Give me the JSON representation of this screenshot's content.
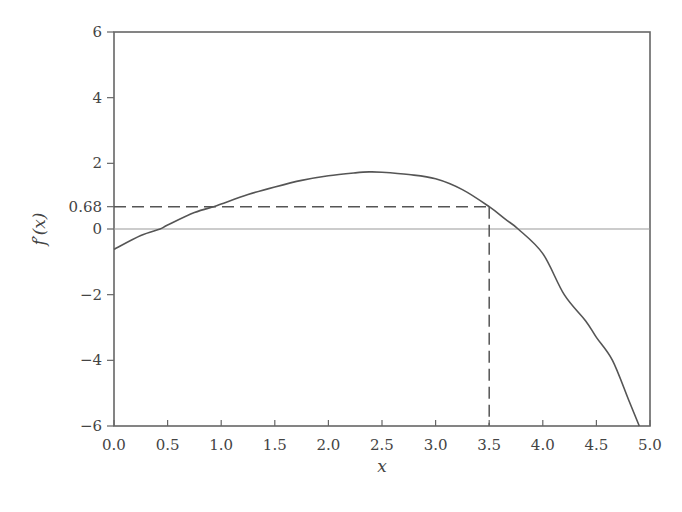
{
  "chart_data": {
    "type": "line",
    "title": "",
    "xlabel": "x",
    "ylabel": "f′(x)",
    "xlim": [
      0.0,
      5.0
    ],
    "ylim": [
      -6,
      6
    ],
    "grid": false,
    "legend": null,
    "x_ticks": [
      "0.0",
      "0.5",
      "1.0",
      "1.5",
      "2.0",
      "2.5",
      "3.0",
      "3.5",
      "4.0",
      "4.5",
      "5.0"
    ],
    "y_ticks": [
      "6",
      "4",
      "2",
      "0.68",
      "0",
      "−2",
      "−4",
      "−6"
    ],
    "y_tick_values": [
      6,
      4,
      2,
      0.68,
      0,
      -2,
      -4,
      -6
    ],
    "series": [
      {
        "name": "f'(x)",
        "color": "#555555",
        "x": [
          0.0,
          0.25,
          0.43,
          0.5,
          0.75,
          0.93,
          1.0,
          1.25,
          1.5,
          1.75,
          2.0,
          2.25,
          2.38,
          2.5,
          2.75,
          3.0,
          3.25,
          3.5,
          3.65,
          3.77,
          4.0,
          4.2,
          4.4,
          4.5,
          4.65,
          4.8,
          4.9
        ],
        "y": [
          -0.62,
          -0.2,
          0.0,
          0.12,
          0.5,
          0.68,
          0.76,
          1.05,
          1.28,
          1.48,
          1.62,
          1.71,
          1.74,
          1.73,
          1.66,
          1.53,
          1.2,
          0.68,
          0.3,
          0.0,
          -0.75,
          -2.0,
          -2.8,
          -3.3,
          -4.0,
          -5.2,
          -6.0
        ]
      }
    ],
    "annotations": [
      {
        "type": "hline",
        "y": 0,
        "style": "solid-thin",
        "color": "#999999"
      },
      {
        "type": "dashed-guide",
        "from": [
          0.0,
          0.68
        ],
        "corner": [
          3.5,
          0.68
        ],
        "to": [
          3.5,
          -6
        ],
        "label": "0.68"
      }
    ]
  }
}
